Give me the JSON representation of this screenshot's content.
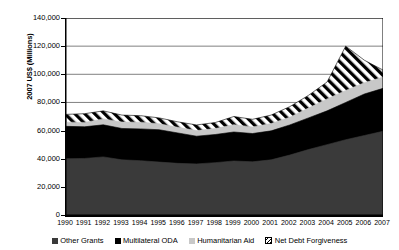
{
  "chart_data": {
    "type": "area",
    "stacked": true,
    "title": "",
    "xlabel": "",
    "ylabel": "2007 US$ (Millions)",
    "ylim": [
      0,
      140000
    ],
    "yticks": [
      0,
      20000,
      40000,
      60000,
      80000,
      100000,
      120000,
      140000
    ],
    "ytick_labels": [
      "0",
      "20,000",
      "40,000",
      "60,000",
      "80,000",
      "100,000",
      "120,000",
      "140,000"
    ],
    "grid": true,
    "grid_axis": "y",
    "legend_position": "bottom",
    "x": [
      1990,
      1991,
      1992,
      1993,
      1994,
      1995,
      1996,
      1997,
      1998,
      1999,
      2000,
      2001,
      2002,
      2003,
      2004,
      2005,
      2006,
      2007
    ],
    "categories": [
      "1990",
      "1991",
      "1992",
      "1993",
      "1994",
      "1995",
      "1996",
      "1997",
      "1998",
      "1999",
      "2000",
      "2001",
      "2002",
      "2003",
      "2004",
      "2005",
      "2006",
      "2007"
    ],
    "series": [
      {
        "name": "Other Grants",
        "fill": "#3a3a3a",
        "pattern": "solid-dark-gray",
        "values": [
          40000,
          40200,
          41300,
          39200,
          38600,
          37600,
          36700,
          36300,
          37200,
          38400,
          37800,
          39200,
          42600,
          46500,
          50000,
          53500,
          56500,
          59500
        ]
      },
      {
        "name": "Multilateral ODA",
        "fill": "#000000",
        "pattern": "solid-black",
        "values": [
          23000,
          22500,
          22800,
          22300,
          22600,
          23000,
          21600,
          19700,
          20000,
          20600,
          20100,
          20600,
          21400,
          22500,
          24000,
          26500,
          29500,
          30500
        ]
      },
      {
        "name": "Humanitarian Aid",
        "fill": "#c8c8c8",
        "pattern": "solid-light-gray",
        "values": [
          3000,
          3100,
          4200,
          4600,
          4800,
          4200,
          4000,
          4000,
          4200,
          5200,
          4700,
          5200,
          5500,
          7000,
          8500,
          8500,
          8000,
          8000
        ]
      },
      {
        "name": "Net Debt Forgiveness",
        "fill": "#ffffff",
        "pattern": "diagonal-hatch",
        "values": [
          5500,
          6200,
          5700,
          4900,
          4600,
          4200,
          3900,
          4000,
          4300,
          5800,
          5400,
          6000,
          7500,
          9000,
          12000,
          31500,
          16000,
          5000
        ]
      }
    ],
    "totals": [
      71500,
      72000,
      74000,
      71000,
      70600,
      69000,
      66200,
      64000,
      65700,
      70000,
      68000,
      71000,
      77000,
      85000,
      94500,
      120000,
      110000,
      103000
    ]
  },
  "legend": {
    "items": [
      {
        "label": "Other Grants",
        "swatch": "solid-dark-gray"
      },
      {
        "label": "Multilateral ODA",
        "swatch": "solid-black"
      },
      {
        "label": "Humanitarian Aid",
        "swatch": "solid-light-gray"
      },
      {
        "label": "Net Debt Forgiveness",
        "swatch": "diagonal-hatch"
      }
    ]
  }
}
